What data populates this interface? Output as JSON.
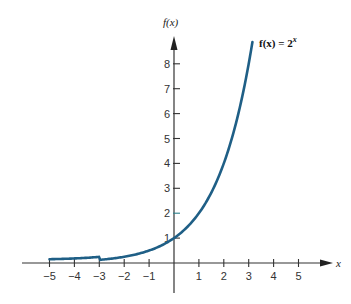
{
  "chart_data": {
    "type": "line",
    "title": "",
    "xlabel": "x",
    "ylabel": "f(x)",
    "xlim": [
      -5.5,
      6.2
    ],
    "ylim": [
      -1.2,
      9
    ],
    "grid": false,
    "x_ticks": [
      -5,
      -4,
      -3,
      -2,
      -1,
      1,
      2,
      3,
      4,
      5
    ],
    "y_ticks": [
      1,
      2,
      3,
      4,
      5,
      6,
      7,
      8
    ],
    "series": [
      {
        "name": "f(x) = 2^x",
        "label_text": "f(x) = 2",
        "label_exponent": "x",
        "function": "2^x",
        "x_range": [
          -5,
          3.15
        ],
        "color": "#1f5f86",
        "x": [
          -5,
          -4,
          -3,
          -2,
          -1,
          0,
          1,
          2,
          3,
          3.15
        ],
        "values": [
          0.03125,
          0.0625,
          0.125,
          0.25,
          0.5,
          1,
          2,
          4,
          8,
          8.88
        ]
      }
    ],
    "annotations": [
      {
        "text": "1",
        "at": [
          0,
          1
        ],
        "note": "y-intercept label"
      }
    ]
  },
  "labels": {
    "y_axis": "f(x)",
    "x_axis": "x",
    "function_label": "f(x) = 2",
    "function_exponent": "x",
    "x_tick_labels": [
      "−5",
      "−4",
      "−3",
      "−2",
      "−1",
      "1",
      "2",
      "3",
      "4",
      "5"
    ],
    "y_tick_labels": [
      "1",
      "2",
      "3",
      "4",
      "5",
      "6",
      "7",
      "8"
    ]
  }
}
